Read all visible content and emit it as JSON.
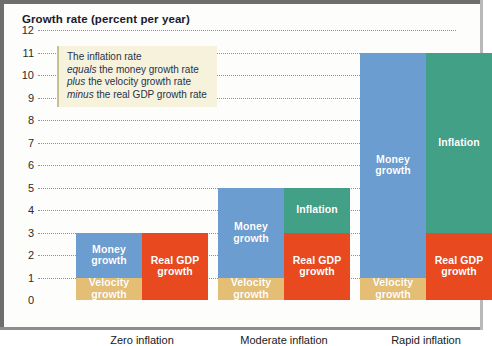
{
  "figure": {
    "title": "Growth rate (percent per year)"
  },
  "callout": {
    "lines": [
      {
        "lead": "",
        "emphasis": "",
        "rest": "The inflation rate"
      },
      {
        "lead": "",
        "emphasis": "equals",
        "rest": " the money growth rate"
      },
      {
        "lead": "",
        "emphasis": "plus",
        "rest": " the velocity growth rate"
      },
      {
        "lead": "",
        "emphasis": "minus",
        "rest": " the real GDP growth rate"
      }
    ]
  },
  "colors": {
    "money_growth": "#6b9dd0",
    "velocity_growth": "#e3be74",
    "real_gdp_growth": "#e8491f",
    "inflation": "#42a087",
    "callout_background": "#f7f2dc",
    "gridline": "#7d8fa6",
    "title_text": "#1a1a2e"
  },
  "chart_data": {
    "type": "bar",
    "title": "Growth rate (percent per year)",
    "xlabel": "",
    "ylabel": "Growth rate (percent per year)",
    "ylim": [
      0,
      12
    ],
    "ytick_labels": [
      "12",
      "11",
      "10",
      "9",
      "8",
      "7",
      "6",
      "5",
      "4",
      "3",
      "2",
      "1",
      "0"
    ],
    "ytick_values": [
      12,
      11,
      10,
      9,
      8,
      7,
      6,
      5,
      4,
      3,
      2,
      1,
      0
    ],
    "grid": true,
    "grid_style": "dotted-horizontal",
    "legend": "in-bar labels",
    "categories": [
      "Zero inflation",
      "Moderate inflation",
      "Rapid inflation"
    ],
    "stacking": "each category shows two side-by-side stacked bars: left bar = money growth on top of velocity growth (sources), right bar = inflation on top of real GDP growth (uses)",
    "groups": [
      {
        "category": "Zero inflation",
        "left_bar": {
          "name": "sources",
          "segments": [
            {
              "label": "Money\ngrowth",
              "key": "money",
              "from": 1,
              "to": 3,
              "value": 2
            },
            {
              "label": "Velocity\ngrowth",
              "key": "velocity",
              "from": 0,
              "to": 1,
              "value": 1
            }
          ]
        },
        "right_bar": {
          "name": "uses",
          "segments": [
            {
              "label": "Real GDP\ngrowth",
              "key": "gdp",
              "from": 0,
              "to": 3,
              "value": 3
            }
          ]
        }
      },
      {
        "category": "Moderate inflation",
        "left_bar": {
          "name": "sources",
          "segments": [
            {
              "label": "Money\ngrowth",
              "key": "money",
              "from": 1,
              "to": 5,
              "value": 4
            },
            {
              "label": "Velocity\ngrowth",
              "key": "velocity",
              "from": 0,
              "to": 1,
              "value": 1
            }
          ]
        },
        "right_bar": {
          "name": "uses",
          "segments": [
            {
              "label": "Inflation",
              "key": "inflation",
              "from": 3,
              "to": 5,
              "value": 2
            },
            {
              "label": "Real GDP\ngrowth",
              "key": "gdp",
              "from": 0,
              "to": 3,
              "value": 3
            }
          ]
        }
      },
      {
        "category": "Rapid inflation",
        "left_bar": {
          "name": "sources",
          "segments": [
            {
              "label": "Money\ngrowth",
              "key": "money",
              "from": 1,
              "to": 11,
              "value": 10
            },
            {
              "label": "Velocity\ngrowth",
              "key": "velocity",
              "from": 0,
              "to": 1,
              "value": 1
            }
          ]
        },
        "right_bar": {
          "name": "uses",
          "segments": [
            {
              "label": "Inflation",
              "key": "inflation",
              "from": 3,
              "to": 11,
              "value": 8
            },
            {
              "label": "Real GDP\ngrowth",
              "key": "gdp",
              "from": 0,
              "to": 3,
              "value": 3
            }
          ]
        }
      }
    ]
  }
}
